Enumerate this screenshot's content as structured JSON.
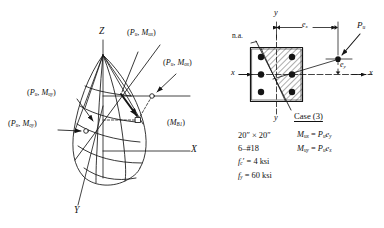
{
  "figure": {
    "ink_color": "#141414",
    "background": "#ffffff"
  },
  "left_diagram": {
    "name": "interaction-surface-3d",
    "axes": [
      {
        "id": "z",
        "label": "Z"
      },
      {
        "id": "x",
        "label": "X"
      },
      {
        "id": "y",
        "label": "Y"
      }
    ],
    "point_labels": [
      {
        "id": "pu-mux",
        "text": "(Pᵤ, Mᵤₓ)",
        "p": "P",
        "psub": "u",
        "m": "M",
        "msub": "ux"
      },
      {
        "id": "pu-mox",
        "text": "(Pᵤ, Mₒₓ)",
        "p": "P",
        "psub": "u",
        "m": "M",
        "msub": "ox"
      },
      {
        "id": "pu-muy",
        "text": "(Pᵤ, Mᵤᵧ)",
        "p": "P",
        "psub": "u",
        "m": "M",
        "msub": "uy"
      },
      {
        "id": "pu-moy",
        "text": "(Pᵤ, Mₒᵧ)",
        "p": "P",
        "psub": "u",
        "m": "M",
        "msub": "oy"
      }
    ],
    "surface_label": {
      "id": "mb1",
      "m": "M",
      "msub": "B1",
      "text": "(Mʙ₁)"
    }
  },
  "right_diagram": {
    "name": "column-cross-section",
    "neutral_axis_label": "n.a.",
    "axis_labels": {
      "top_y": "y",
      "bottom_y": "y",
      "left_x": "x",
      "right_x": "x"
    },
    "load_label": {
      "symbol": "P",
      "sub": "u"
    },
    "dimensions": [
      {
        "id": "ex",
        "symbol": "e",
        "sub": "x"
      },
      {
        "id": "ey",
        "symbol": "e",
        "sub": "y"
      }
    ],
    "rebar_count": 6,
    "rebar_grid": {
      "columns": 2,
      "rows": 3
    }
  },
  "annotations": {
    "case_label": "Case (3)",
    "specs": [
      {
        "id": "size",
        "text": "20″ × 20″"
      },
      {
        "id": "bars",
        "text": "6–#18"
      },
      {
        "id": "fc",
        "symbol": "f",
        "sub": "c",
        "prime": "′",
        "value": "= 4 ksi"
      },
      {
        "id": "fy",
        "symbol": "f",
        "sub": "y",
        "prime": "",
        "value": "= 60 ksi"
      }
    ],
    "equations": [
      {
        "id": "mux",
        "lhs_sym": "M",
        "lhs_sub": "ux",
        "rhs": "= Pᵤeᵧ",
        "rhs_p": "P",
        "rhs_psub": "u",
        "rhs_e": "e",
        "rhs_esub": "y"
      },
      {
        "id": "muy",
        "lhs_sym": "M",
        "lhs_sub": "uy",
        "rhs": "= Pᵤeₓ",
        "rhs_p": "P",
        "rhs_psub": "u",
        "rhs_e": "e",
        "rhs_esub": "x"
      }
    ]
  }
}
